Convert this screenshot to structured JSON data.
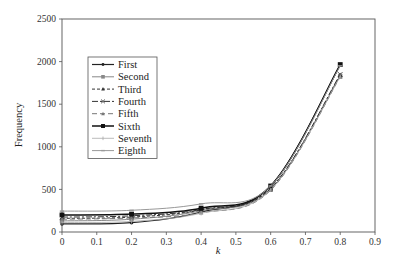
{
  "chart_data": {
    "type": "line",
    "title": "",
    "xlabel": "k",
    "ylabel": "Frequency",
    "xlim": [
      0,
      0.9
    ],
    "ylim": [
      0,
      2500
    ],
    "x_ticks": [
      "0",
      "0.1",
      "0.2",
      "0.3",
      "0.4",
      "0.5",
      "0.6",
      "0.7",
      "0.8",
      "0.9"
    ],
    "y_ticks": [
      "0",
      "500",
      "1000",
      "1500",
      "2000",
      "2500"
    ],
    "grid": false,
    "legend_position": "upper-left (inside)",
    "x": [
      0,
      0.2,
      0.4,
      0.6,
      0.8
    ],
    "series": [
      {
        "name": "First",
        "values": [
          95,
          110,
          235,
          540,
          1960
        ],
        "color": "#222222",
        "dash": "",
        "marker": "dot",
        "width": 1.2
      },
      {
        "name": "Second",
        "values": [
          130,
          150,
          250,
          500,
          1830
        ],
        "color": "#888888",
        "dash": "",
        "marker": "square",
        "width": 1.0
      },
      {
        "name": "Third",
        "values": [
          160,
          175,
          260,
          510,
          1840
        ],
        "color": "#333333",
        "dash": "3,2",
        "marker": "triangle",
        "width": 1.0
      },
      {
        "name": "Fourth",
        "values": [
          175,
          190,
          265,
          515,
          1850
        ],
        "color": "#333333",
        "dash": "6,2,2,2",
        "marker": "x",
        "width": 1.0
      },
      {
        "name": "Fifth",
        "values": [
          150,
          165,
          225,
          490,
          1820
        ],
        "color": "#777777",
        "dash": "5,3",
        "marker": "triangle",
        "width": 1.0
      },
      {
        "name": "Sixth",
        "values": [
          200,
          210,
          280,
          540,
          1965
        ],
        "color": "#111111",
        "dash": "",
        "marker": "dot-large",
        "width": 1.5
      },
      {
        "name": "Seventh",
        "values": [
          110,
          125,
          220,
          495,
          1825
        ],
        "color": "#aaaaaa",
        "dash": "",
        "marker": "plus",
        "width": 0.8
      },
      {
        "name": "Eighth",
        "values": [
          245,
          255,
          330,
          540,
          1950
        ],
        "color": "#999999",
        "dash": "",
        "marker": "dash",
        "width": 1.0
      }
    ]
  }
}
